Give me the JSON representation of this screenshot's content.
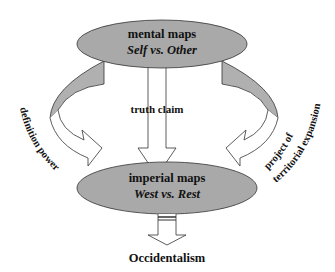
{
  "diagram": {
    "top_node": {
      "title": "mental maps",
      "subtitle": "Self vs. Other"
    },
    "bottom_node": {
      "title": "imperial maps",
      "subtitle": "West vs. Rest"
    },
    "center_arrow_label": "truth claim",
    "left_arrow_label": "definition power",
    "right_arrow_label_line1": "project of",
    "right_arrow_label_line2": "territorial expansion",
    "output_label": "Occidentalism",
    "colors": {
      "ellipse_fill": "#a9a9a9",
      "arrow_band_fill": "#b0b0b0",
      "stroke": "#333333",
      "text": "#111111"
    }
  }
}
